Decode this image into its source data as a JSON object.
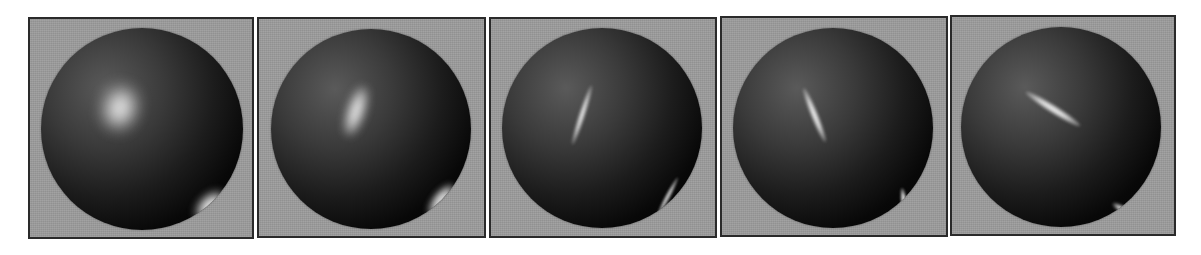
{
  "figure": {
    "background_color": "#ffffff",
    "panel_background": "#9c9c9c",
    "panel_border": "#2a2a2a",
    "panels": [
      {
        "index": 1,
        "box": {
          "x": 28,
          "y": 17,
          "w": 226,
          "h": 222
        },
        "sphere": {
          "cx": 112,
          "cy": 110,
          "r": 101
        },
        "highlights": [
          {
            "x": 62,
            "y": 58,
            "w": 34,
            "h": 44,
            "rot": 15,
            "blur": 8,
            "opacity": 0.95,
            "label": "primary-soft"
          },
          {
            "x": 158,
            "y": 160,
            "w": 22,
            "h": 36,
            "rot": 45,
            "blur": 4,
            "opacity": 0.95,
            "label": "secondary"
          }
        ]
      },
      {
        "index": 2,
        "box": {
          "x": 257,
          "y": 17,
          "w": 229,
          "h": 221
        },
        "sphere": {
          "cx": 112,
          "cy": 110,
          "r": 100
        },
        "highlights": [
          {
            "x": 76,
            "y": 56,
            "w": 18,
            "h": 52,
            "rot": 18,
            "blur": 5,
            "opacity": 0.9,
            "label": "primary-elongated"
          },
          {
            "x": 162,
            "y": 152,
            "w": 16,
            "h": 38,
            "rot": 38,
            "blur": 3,
            "opacity": 0.9,
            "label": "secondary"
          }
        ]
      },
      {
        "index": 3,
        "box": {
          "x": 489,
          "y": 17,
          "w": 228,
          "h": 221
        },
        "sphere": {
          "cx": 111,
          "cy": 109,
          "r": 100
        },
        "highlights": [
          {
            "x": 77,
            "y": 56,
            "w": 6,
            "h": 62,
            "rot": 18,
            "blur": 1.5,
            "opacity": 0.85,
            "label": "primary-streak"
          },
          {
            "x": 163,
            "y": 147,
            "w": 5,
            "h": 44,
            "rot": 28,
            "blur": 1.2,
            "opacity": 0.75,
            "label": "secondary-streak"
          }
        ]
      },
      {
        "index": 4,
        "box": {
          "x": 720,
          "y": 16,
          "w": 228,
          "h": 221
        },
        "sphere": {
          "cx": 111,
          "cy": 110,
          "r": 100
        },
        "highlights": [
          {
            "x": 78,
            "y": 58,
            "w": 7,
            "h": 58,
            "rot": -22,
            "blur": 1.5,
            "opacity": 0.9,
            "label": "primary-streak"
          },
          {
            "x": 168,
            "y": 160,
            "w": 6,
            "h": 28,
            "rot": -8,
            "blur": 1,
            "opacity": 0.9,
            "label": "secondary-streak"
          }
        ]
      },
      {
        "index": 5,
        "box": {
          "x": 950,
          "y": 15,
          "w": 226,
          "h": 221
        },
        "sphere": {
          "cx": 109,
          "cy": 110,
          "r": 100
        },
        "highlights": [
          {
            "x": 60,
            "y": 78,
            "w": 64,
            "h": 8,
            "rot": 32,
            "blur": 1.8,
            "opacity": 0.9,
            "label": "primary-arc"
          },
          {
            "x": 150,
            "y": 180,
            "w": 26,
            "h": 7,
            "rot": 32,
            "blur": 1.5,
            "opacity": 0.9,
            "label": "secondary"
          }
        ]
      }
    ]
  }
}
